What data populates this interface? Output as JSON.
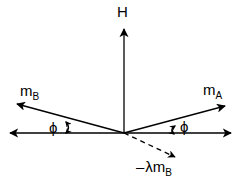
{
  "figure": {
    "background_color": "#ffffff",
    "stroke_color": "#000000",
    "width": 243,
    "height": 186
  },
  "origin": {
    "x": 124,
    "y": 133
  },
  "labels": {
    "field": {
      "text": "H",
      "sub": ""
    },
    "moment_a": {
      "text": "m",
      "sub": "A"
    },
    "moment_b": {
      "text": "m",
      "sub": "B"
    },
    "angle_left": {
      "text": "ϕ",
      "sub": ""
    },
    "angle_right": {
      "text": "ϕ",
      "sub": ""
    },
    "exchange_field": {
      "minus": "–",
      "text": "λm",
      "sub": "B"
    }
  },
  "vectors": [
    {
      "name": "field-H",
      "label": "H",
      "from": [
        124,
        133
      ],
      "to": [
        124,
        24
      ],
      "style": "solid",
      "arrow": "end"
    },
    {
      "name": "moment-A",
      "label": "mA",
      "from": [
        124,
        133
      ],
      "to": [
        230,
        104
      ],
      "style": "solid",
      "arrow": "end"
    },
    {
      "name": "moment-B",
      "label": "mB",
      "from": [
        124,
        133
      ],
      "to": [
        12,
        102
      ],
      "style": "solid",
      "arrow": "end"
    },
    {
      "name": "exchange-field",
      "label": "-lambda mB",
      "from": [
        124,
        133
      ],
      "to": [
        180,
        159
      ],
      "style": "dashed",
      "arrow": "end"
    }
  ],
  "axis": {
    "name": "horizontal-axis",
    "from": [
      5,
      133
    ],
    "to": [
      236,
      133
    ],
    "style": "solid",
    "arrow": "both"
  },
  "angles": [
    {
      "name": "angle-left",
      "label": "ϕ",
      "value_deg": 15.5,
      "side": "left"
    },
    {
      "name": "angle-right",
      "label": "ϕ",
      "value_deg": 15.5,
      "side": "right"
    }
  ]
}
